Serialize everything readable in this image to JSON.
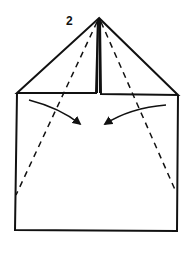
{
  "diagram": {
    "step_number": "2",
    "colors": {
      "line": "#111111",
      "background": "#ffffff"
    },
    "elements": [
      "square-base",
      "left-triangle-flap",
      "right-triangle-flap",
      "left-dashed-fold-line",
      "right-dashed-fold-line",
      "left-fold-arrow",
      "right-fold-arrow"
    ]
  }
}
